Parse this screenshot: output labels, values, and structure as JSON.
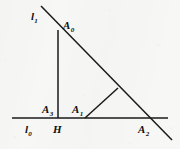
{
  "figure": {
    "kind": "geometry-diagram",
    "background_color": "#f7f7f6",
    "ink_color": "#1a1a1a",
    "canvas": {
      "width": 180,
      "height": 149
    },
    "lines": {
      "base_line": {
        "name": "l0",
        "x1": 12,
        "y1": 118,
        "x2": 168,
        "y2": 118,
        "stroke_width": 1.5
      },
      "oblique_line": {
        "name": "l1",
        "x1": 41,
        "y1": 6,
        "x2": 172,
        "y2": 140,
        "stroke_width": 1.5
      },
      "altitude_segment": {
        "name": "A0-H",
        "x1": 58,
        "y1": 30,
        "x2": 58,
        "y2": 118,
        "stroke_width": 1.5
      },
      "perpendicular_segment": {
        "name": "A1-foot",
        "x1": 85,
        "y1": 118,
        "x2": 118,
        "y2": 88,
        "stroke_width": 1.5
      }
    },
    "labels": [
      {
        "id": "l1",
        "base": "l",
        "sub": "1",
        "x": 31,
        "y": 7,
        "role": "oblique-line-label"
      },
      {
        "id": "A0",
        "base": "A",
        "sub": "0",
        "x": 63,
        "y": 16,
        "role": "apex-point-label"
      },
      {
        "id": "A3",
        "base": "A",
        "sub": "3",
        "x": 42,
        "y": 100,
        "role": "point-label"
      },
      {
        "id": "A1",
        "base": "A",
        "sub": "1",
        "x": 72,
        "y": 100,
        "role": "point-label"
      },
      {
        "id": "l0",
        "base": "l",
        "sub": "0",
        "x": 25,
        "y": 120,
        "role": "base-line-label"
      },
      {
        "id": "H",
        "base": "H",
        "sub": "",
        "x": 53,
        "y": 120,
        "role": "foot-point-label"
      },
      {
        "id": "A2",
        "base": "A",
        "sub": "2",
        "x": 138,
        "y": 120,
        "role": "point-label"
      }
    ]
  }
}
